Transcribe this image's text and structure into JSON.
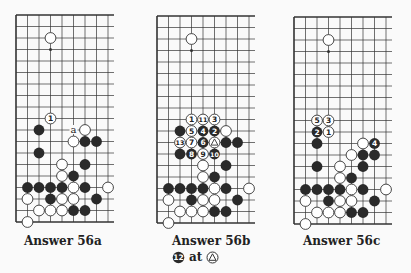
{
  "colors": {
    "line": "#333333",
    "black_stone": "#2a2a2a",
    "white_stone": "#ffffff",
    "paper": "#fafafa"
  },
  "grid": {
    "spacing": 11.5,
    "cols": 9,
    "rows": 19
  },
  "common_stones": [
    {
      "c": 3,
      "r": 2,
      "color": "W"
    },
    {
      "c": 4,
      "r": 13,
      "color": "W"
    },
    {
      "c": 6,
      "r": 13,
      "color": "B"
    },
    {
      "c": 4,
      "r": 14,
      "color": "W"
    },
    {
      "c": 5,
      "r": 14,
      "color": "B"
    },
    {
      "c": 1,
      "r": 15,
      "color": "B"
    },
    {
      "c": 2,
      "r": 15,
      "color": "B"
    },
    {
      "c": 3,
      "r": 15,
      "color": "B"
    },
    {
      "c": 4,
      "r": 15,
      "color": "B"
    },
    {
      "c": 5,
      "r": 15,
      "color": "W"
    },
    {
      "c": 6,
      "r": 15,
      "color": "B"
    },
    {
      "c": 8,
      "r": 15,
      "color": "W"
    },
    {
      "c": 1,
      "r": 16,
      "color": "W"
    },
    {
      "c": 3,
      "r": 16,
      "color": "B"
    },
    {
      "c": 4,
      "r": 16,
      "color": "W"
    },
    {
      "c": 5,
      "r": 16,
      "color": "W"
    },
    {
      "c": 7,
      "r": 16,
      "color": "B"
    },
    {
      "c": 2,
      "r": 17,
      "color": "W"
    },
    {
      "c": 3,
      "r": 17,
      "color": "W"
    },
    {
      "c": 4,
      "r": 17,
      "color": "W"
    },
    {
      "c": 5,
      "r": 17,
      "color": "B"
    },
    {
      "c": 6,
      "r": 17,
      "color": "B"
    },
    {
      "c": 1,
      "r": 18,
      "color": "W"
    }
  ],
  "boards": [
    {
      "id": "56a",
      "x": 16,
      "y": 15,
      "caption": "Answer   56a",
      "stones": [
        {
          "c": 3,
          "r": 9,
          "color": "W",
          "label": "1"
        },
        {
          "c": 2,
          "r": 10,
          "color": "B"
        },
        {
          "c": 6,
          "r": 10,
          "color": "W"
        },
        {
          "c": 5,
          "r": 11,
          "color": "W"
        },
        {
          "c": 6,
          "r": 11,
          "color": "B"
        },
        {
          "c": 7,
          "r": 11,
          "color": "B"
        },
        {
          "c": 2,
          "r": 12,
          "color": "B"
        }
      ],
      "marks": [
        {
          "c": 5,
          "r": 10,
          "text": "a"
        }
      ]
    },
    {
      "id": "56b",
      "x": 157,
      "y": 16,
      "caption": "Answer   56b",
      "stones": [
        {
          "c": 3,
          "r": 9,
          "color": "W",
          "label": "1"
        },
        {
          "c": 4,
          "r": 9,
          "color": "W",
          "label": "11"
        },
        {
          "c": 5,
          "r": 9,
          "color": "W",
          "label": "3"
        },
        {
          "c": 2,
          "r": 10,
          "color": "B"
        },
        {
          "c": 3,
          "r": 10,
          "color": "W",
          "label": "5"
        },
        {
          "c": 4,
          "r": 10,
          "color": "B",
          "label": "4"
        },
        {
          "c": 5,
          "r": 10,
          "color": "B",
          "label": "2"
        },
        {
          "c": 6,
          "r": 10,
          "color": "W"
        },
        {
          "c": 2,
          "r": 11,
          "color": "W",
          "label": "13"
        },
        {
          "c": 3,
          "r": 11,
          "color": "W",
          "label": "7"
        },
        {
          "c": 4,
          "r": 11,
          "color": "B",
          "label": "6"
        },
        {
          "c": 5,
          "r": 11,
          "color": "W",
          "label": "△"
        },
        {
          "c": 6,
          "r": 11,
          "color": "B"
        },
        {
          "c": 7,
          "r": 11,
          "color": "B"
        },
        {
          "c": 2,
          "r": 12,
          "color": "B"
        },
        {
          "c": 3,
          "r": 12,
          "color": "B",
          "label": "8"
        },
        {
          "c": 4,
          "r": 12,
          "color": "W",
          "label": "9"
        },
        {
          "c": 5,
          "r": 12,
          "color": "B",
          "label": "10"
        }
      ],
      "marks": [],
      "note": {
        "stone_label": "12",
        "text": "at"
      }
    },
    {
      "id": "56c",
      "x": 294,
      "y": 17,
      "caption": "Answer   56c",
      "stones": [
        {
          "c": 2,
          "r": 9,
          "color": "W",
          "label": "5"
        },
        {
          "c": 3,
          "r": 9,
          "color": "W",
          "label": "3"
        },
        {
          "c": 2,
          "r": 10,
          "color": "B",
          "label": "2"
        },
        {
          "c": 3,
          "r": 10,
          "color": "W",
          "label": "1"
        },
        {
          "c": 2,
          "r": 11,
          "color": "B"
        },
        {
          "c": 6,
          "r": 11,
          "color": "W"
        },
        {
          "c": 7,
          "r": 11,
          "color": "B",
          "label": "4"
        },
        {
          "c": 5,
          "r": 12,
          "color": "W"
        },
        {
          "c": 6,
          "r": 12,
          "color": "B"
        },
        {
          "c": 7,
          "r": 12,
          "color": "B"
        },
        {
          "c": 2,
          "r": 13,
          "color": "B"
        }
      ],
      "marks": []
    }
  ]
}
